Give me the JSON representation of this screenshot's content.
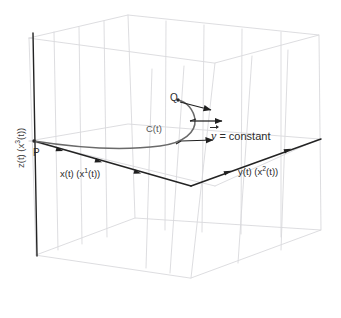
{
  "figure": {
    "type": "3d-vector-diagram",
    "background_color": "#ffffff",
    "box_line_color": "#d8d8dc",
    "axis_line_color": "#2b2b2b",
    "curve_color": "#6a6a6a",
    "text_color": "#2b2b2b"
  },
  "axes": {
    "z": {
      "label": "z(t) (x",
      "label_sup": "3",
      "label_tail": "(t))",
      "full": "z(t) (x3(t))"
    },
    "x": {
      "label": "x(t) (x",
      "label_sup": "1",
      "label_tail": "(t))",
      "full": "x(t) (x1(t))"
    },
    "y": {
      "label": "y(t) (x",
      "label_sup": "2",
      "label_tail": "(t))",
      "full": "y(t) (x2(t))"
    }
  },
  "points": {
    "start": "P",
    "end": "Q"
  },
  "curve": {
    "label": "C(t)"
  },
  "vector": {
    "symbol": "v",
    "statement": "= constant",
    "full": "v = constant"
  }
}
